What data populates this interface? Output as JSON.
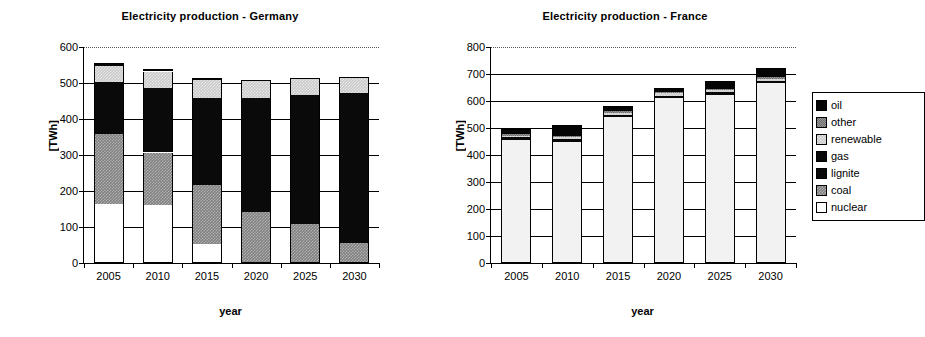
{
  "charts": [
    {
      "id": "germany",
      "title": "Electricity production - Germany",
      "xlabel": "year",
      "ylabel": "[TWh]"
    },
    {
      "id": "france",
      "title": "Electricity production - France",
      "xlabel": "year",
      "ylabel": "[TWh]"
    }
  ],
  "legend": {
    "position": "right",
    "items": [
      {
        "label": "oil",
        "key": "oil",
        "color": "#050505"
      },
      {
        "label": "other",
        "key": "other",
        "color": "#6e6e6e"
      },
      {
        "label": "renewable",
        "key": "renewable",
        "color": "#c9c9c9"
      },
      {
        "label": "gas",
        "key": "gas",
        "color": "#080808"
      },
      {
        "label": "lignite",
        "key": "lignite",
        "color": "#0a0a0a"
      },
      {
        "label": "coal",
        "key": "coal",
        "color": "#808080"
      },
      {
        "label": "nuclear",
        "key": "nuclear",
        "color": "#ffffff"
      }
    ]
  },
  "chart_data": [
    {
      "type": "bar",
      "stacked": true,
      "id": "germany",
      "title": "Electricity production - Germany",
      "xlabel": "year",
      "ylabel": "[TWh]",
      "categories": [
        "2005",
        "2010",
        "2015",
        "2020",
        "2025",
        "2030"
      ],
      "ylim": [
        0,
        600
      ],
      "yticks": [
        0,
        100,
        200,
        300,
        400,
        500,
        600
      ],
      "grid": true,
      "stack_order_bottom_to_top": [
        "nuclear",
        "coal",
        "lignite",
        "gas",
        "renewable",
        "other",
        "oil"
      ],
      "series": [
        {
          "name": "nuclear",
          "values": [
            163,
            162,
            53,
            0,
            0,
            0
          ]
        },
        {
          "name": "coal",
          "values": [
            195,
            145,
            165,
            143,
            108,
            55
          ]
        },
        {
          "name": "lignite",
          "values": [
            146,
            180,
            241,
            315,
            360,
            417
          ]
        },
        {
          "name": "gas",
          "values": [
            0,
            0,
            0,
            0,
            0,
            0
          ]
        },
        {
          "name": "renewable",
          "values": [
            44,
            45,
            49,
            51,
            47,
            45
          ]
        },
        {
          "name": "other",
          "values": [
            0,
            0,
            0,
            0,
            0,
            0
          ]
        },
        {
          "name": "oil",
          "values": [
            8,
            7,
            7,
            0,
            0,
            0
          ]
        }
      ],
      "totals": [
        556,
        539,
        515,
        509,
        515,
        517
      ]
    },
    {
      "type": "bar",
      "stacked": true,
      "id": "france",
      "title": "Electricity production - France",
      "xlabel": "year",
      "ylabel": "[TWh]",
      "categories": [
        "2005",
        "2010",
        "2015",
        "2020",
        "2025",
        "2030"
      ],
      "ylim": [
        0,
        800
      ],
      "yticks": [
        0,
        100,
        200,
        300,
        400,
        500,
        600,
        700,
        800
      ],
      "grid": true,
      "stack_order_bottom_to_top": [
        "nuclear",
        "coal",
        "lignite",
        "gas",
        "renewable",
        "other",
        "oil"
      ],
      "series": [
        {
          "name": "nuclear",
          "values": [
            457,
            450,
            540,
            612,
            624,
            666
          ]
        },
        {
          "name": "coal",
          "values": [
            0,
            0,
            0,
            0,
            0,
            0
          ]
        },
        {
          "name": "lignite",
          "values": [
            0,
            0,
            0,
            0,
            0,
            0
          ]
        },
        {
          "name": "gas",
          "values": [
            8,
            8,
            8,
            8,
            8,
            8
          ]
        },
        {
          "name": "renewable",
          "values": [
            7,
            8,
            9,
            8,
            8,
            8
          ]
        },
        {
          "name": "other",
          "values": [
            6,
            6,
            6,
            6,
            6,
            6
          ]
        },
        {
          "name": "oil",
          "values": [
            20,
            38,
            19,
            14,
            29,
            33
          ]
        }
      ],
      "totals": [
        498,
        510,
        582,
        648,
        675,
        715
      ]
    }
  ]
}
